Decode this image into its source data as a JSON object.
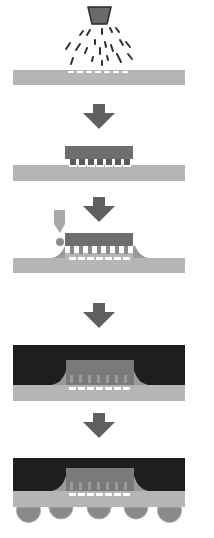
{
  "diagram": {
    "colors": {
      "background": "#ffffff",
      "substrate": "#b5b5b5",
      "die": "#6e6e6e",
      "bump": "#5a5a5a",
      "pad": "#ffffff",
      "nozzle": "#6a6a6a",
      "droplet": "#2e2e2e",
      "arrow": "#5f5f5f",
      "underfill": "#8d8d8d",
      "dispenser": "#a8a8a8",
      "mold": "#1e1e1e",
      "solder_ball": "#8a8a8a"
    },
    "steps": [
      {
        "id": 1,
        "name": "flux-spray"
      },
      {
        "id": 2,
        "name": "die-attach"
      },
      {
        "id": 3,
        "name": "underfill-dispense"
      },
      {
        "id": 4,
        "name": "mold-encapsulation"
      },
      {
        "id": 5,
        "name": "solder-ball-attach"
      }
    ],
    "arrows": 4,
    "solder_balls": 5,
    "bumps_per_die": 7
  }
}
